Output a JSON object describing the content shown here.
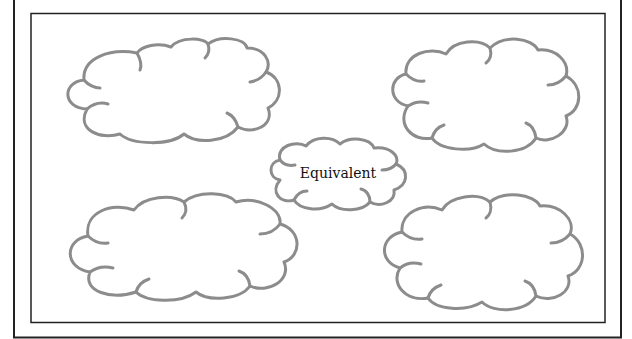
{
  "diagram": {
    "type": "concept-cloud-map",
    "colors": {
      "cloud_stroke": "#8c8c8c",
      "frame_stroke": "#222222",
      "background": "#ffffff"
    },
    "center": {
      "label": "Equivalent"
    },
    "clouds": [
      {
        "position": "top-left",
        "label": ""
      },
      {
        "position": "top-right",
        "label": ""
      },
      {
        "position": "bottom-left",
        "label": ""
      },
      {
        "position": "bottom-right",
        "label": ""
      }
    ]
  }
}
